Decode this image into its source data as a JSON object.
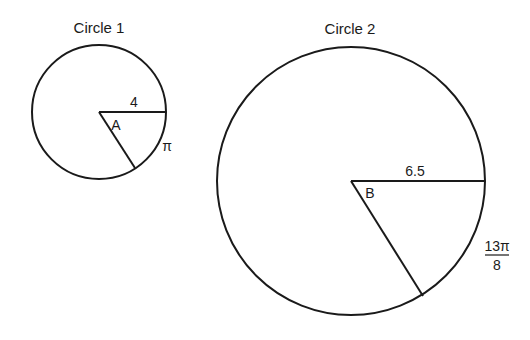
{
  "circle1": {
    "title": "Circle 1",
    "radius_label": "4",
    "angle_label": "A",
    "arc_label": "π"
  },
  "circle2": {
    "title": "Circle 2",
    "radius_label": "6.5",
    "angle_label": "B",
    "arc_label_numerator": "13π",
    "arc_label_denominator": "8"
  },
  "colors": {
    "stroke": "#1a1a1a",
    "background": "#ffffff"
  }
}
